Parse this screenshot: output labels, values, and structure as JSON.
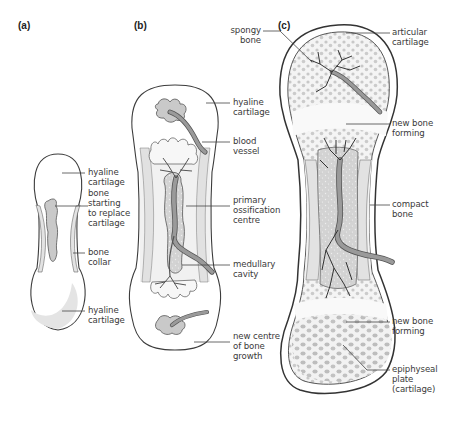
{
  "figure": {
    "panels": [
      {
        "id": "a",
        "label": "(a)",
        "annotations": [
          {
            "text": "hyaline\ncartilage"
          },
          {
            "text": "bone\nstarting\nto replace\ncartilage"
          },
          {
            "text": "bone\ncollar"
          },
          {
            "text": "hyaline\ncartilage"
          }
        ]
      },
      {
        "id": "b",
        "label": "(b)",
        "annotations": [
          {
            "text": "hyaline\ncartilage"
          },
          {
            "text": "blood\nvessel"
          },
          {
            "text": "primary\nossification\ncentre"
          },
          {
            "text": "medullary\ncavity"
          },
          {
            "text": "new centre\nof bone\ngrowth"
          }
        ]
      },
      {
        "id": "c",
        "label": "(c)",
        "annotations": [
          {
            "text": "spongy\nbone"
          },
          {
            "text": "articular\ncartilage"
          },
          {
            "text": "new bone\nforming"
          },
          {
            "text": "compact\nbone"
          },
          {
            "text": "new bone\nforming"
          },
          {
            "text": "epiphyseal\nplate\n(cartilage)"
          }
        ]
      }
    ],
    "colors": {
      "outline": "#3c3c3c",
      "collar": "#e6e6e6",
      "marrow": "#b9b9b9",
      "vessel": "#8a8a8a",
      "spongy_dot": "#c4c4c4",
      "leader": "#444444"
    }
  }
}
